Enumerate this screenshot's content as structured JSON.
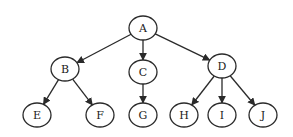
{
  "diagram": {
    "type": "tree",
    "colors": {
      "stroke": "#2a2a2a",
      "text": "#1a1a1a",
      "background": "#ffffff"
    },
    "nodes": [
      {
        "id": "A",
        "label": "A",
        "x": 143,
        "y": 28
      },
      {
        "id": "B",
        "label": "B",
        "x": 65,
        "y": 69
      },
      {
        "id": "C",
        "label": "C",
        "x": 143,
        "y": 72
      },
      {
        "id": "D",
        "label": "D",
        "x": 222,
        "y": 66
      },
      {
        "id": "E",
        "label": "E",
        "x": 37,
        "y": 115
      },
      {
        "id": "F",
        "label": "F",
        "x": 100,
        "y": 115
      },
      {
        "id": "G",
        "label": "G",
        "x": 143,
        "y": 115
      },
      {
        "id": "H",
        "label": "H",
        "x": 184,
        "y": 115
      },
      {
        "id": "I",
        "label": "I",
        "x": 222,
        "y": 115
      },
      {
        "id": "J",
        "label": "J",
        "x": 263,
        "y": 115
      }
    ],
    "edges": [
      {
        "from": "A",
        "to": "B"
      },
      {
        "from": "A",
        "to": "C"
      },
      {
        "from": "A",
        "to": "D"
      },
      {
        "from": "B",
        "to": "E"
      },
      {
        "from": "B",
        "to": "F"
      },
      {
        "from": "C",
        "to": "G"
      },
      {
        "from": "D",
        "to": "H"
      },
      {
        "from": "D",
        "to": "I"
      },
      {
        "from": "D",
        "to": "J"
      }
    ]
  }
}
